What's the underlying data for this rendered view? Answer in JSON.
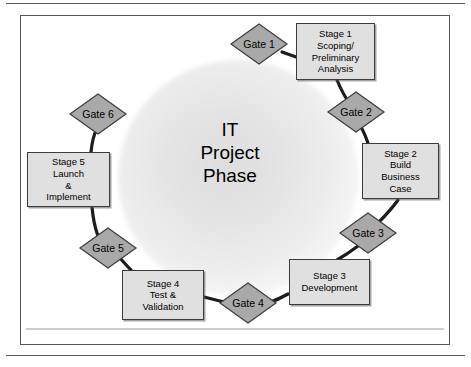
{
  "diagram": {
    "title": "IT\nProject\nPhase",
    "colors": {
      "stage_fill": "#e0e0e0",
      "stage_border": "#3c3c3c",
      "gate_fill": "#a9a9a9",
      "gate_border": "#3c3c3c",
      "connector": "#1c1c1c",
      "frame_border": "#565656",
      "text": "#000000"
    },
    "stages": [
      {
        "id": "stage-1",
        "label": "Stage 1\nScoping/\nPreliminary\nAnalysis",
        "x": 296,
        "y": 23,
        "w": 79,
        "h": 57
      },
      {
        "id": "stage-2",
        "label": "Stage 2\nBuild\nBusiness\nCase",
        "x": 362,
        "y": 143,
        "w": 77,
        "h": 56
      },
      {
        "id": "stage-3",
        "label": "Stage 3\nDevelopment",
        "x": 289,
        "y": 259,
        "w": 81,
        "h": 46
      },
      {
        "id": "stage-4",
        "label": "Stage 4\nTest &\nValidation",
        "x": 122,
        "y": 270,
        "w": 82,
        "h": 50
      },
      {
        "id": "stage-5",
        "label": "Stage 5\nLaunch\n&\nImplement",
        "x": 27,
        "y": 152,
        "w": 83,
        "h": 55
      }
    ],
    "gates": [
      {
        "id": "gate-1",
        "label": "Gate 1",
        "cx": 259,
        "cy": 44
      },
      {
        "id": "gate-2",
        "label": "Gate 2",
        "cx": 356,
        "cy": 112
      },
      {
        "id": "gate-3",
        "label": "Gate 3",
        "cx": 368,
        "cy": 233
      },
      {
        "id": "gate-4",
        "label": "Gate 4",
        "cx": 248,
        "cy": 303
      },
      {
        "id": "gate-5",
        "label": "Gate 5",
        "cx": 108,
        "cy": 248
      },
      {
        "id": "gate-6",
        "label": "Gate 6",
        "cx": 98,
        "cy": 114
      }
    ],
    "connectors": [
      {
        "id": "gate1-to-stage1",
        "d": "M 282,52 L 298,58"
      },
      {
        "id": "stage1-to-gate2",
        "d": "M 336,80 C 341,92 345,98 350,104"
      },
      {
        "id": "gate2-to-stage2",
        "d": "M 362,126 C 366,134 368,140 370,145"
      },
      {
        "id": "stage2-to-gate3",
        "d": "M 398,199 C 390,210 381,218 375,224"
      },
      {
        "id": "gate3-to-stage3",
        "d": "M 358,245 C 350,252 344,256 338,260"
      },
      {
        "id": "stage3-to-gate4",
        "d": "M 289,294 C 281,298 274,301 268,303"
      },
      {
        "id": "gate4-to-stage4",
        "d": "M 228,303 C 220,301 212,299 205,297"
      },
      {
        "id": "stage4-to-gate5",
        "d": "M 131,270 C 126,264 122,259 118,256"
      },
      {
        "id": "gate5-to-stage5",
        "d": "M 98,236 C 95,228 93,218 92,208"
      },
      {
        "id": "stage5-to-gate6",
        "d": "M 91,152 C 92,142 94,134 97,128"
      }
    ]
  }
}
